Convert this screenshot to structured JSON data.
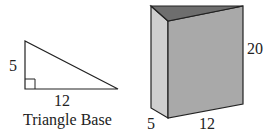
{
  "triangle": {
    "side_vertical_label": "5",
    "side_horizontal_label": "12",
    "caption": "Triangle Base",
    "has_right_angle_marker": true
  },
  "prism": {
    "height_label": "20",
    "depth_label": "5",
    "width_label": "12"
  },
  "colors": {
    "stroke": "#222222",
    "front_face": "#a9a9a9",
    "side_face": "#cfcfcf",
    "top_face": "#6e6e6e"
  }
}
